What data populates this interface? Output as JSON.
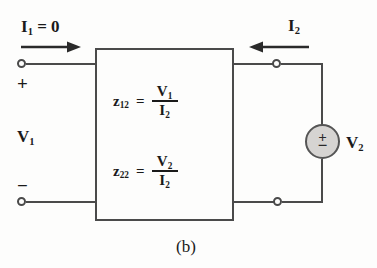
{
  "figure": {
    "caption": "(b)",
    "type": "two-port-network-z-parameters"
  },
  "colors": {
    "wire": "#4a4a4a",
    "text": "#1a1a1a",
    "source_fill": "#d6d4d2",
    "background": "#fdfdfc"
  },
  "left_port": {
    "current_label": {
      "symbol": "I",
      "subscript": "1",
      "equals_value": " = 0",
      "full": "I1 = 0"
    },
    "plus_sign": "+",
    "minus_sign": "−",
    "voltage_label": {
      "symbol": "V",
      "subscript": "1",
      "full": "V1"
    }
  },
  "right_port": {
    "current_label": {
      "symbol": "I",
      "subscript": "2",
      "full": "I2"
    },
    "source": {
      "plus_sign": "+",
      "minus_sign": "−",
      "voltage_label": {
        "symbol": "V",
        "subscript": "2",
        "full": "V2"
      }
    }
  },
  "equations": [
    {
      "lhs_symbol": "z",
      "lhs_subscript": "12",
      "equals": "=",
      "numerator_symbol": "V",
      "numerator_subscript": "1",
      "denominator_symbol": "I",
      "denominator_subscript": "2",
      "full": "z12 = V1 / I2"
    },
    {
      "lhs_symbol": "z",
      "lhs_subscript": "22",
      "equals": "=",
      "numerator_symbol": "V",
      "numerator_subscript": "2",
      "denominator_symbol": "I",
      "denominator_subscript": "2",
      "full": "z22 = V2 / I2"
    }
  ]
}
